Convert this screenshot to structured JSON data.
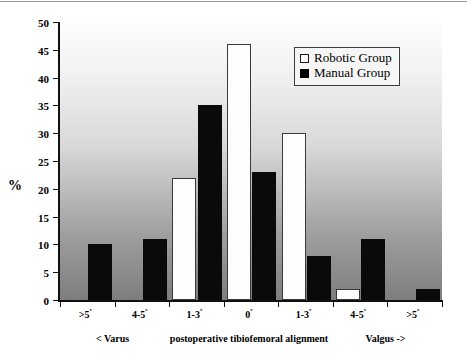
{
  "chart_data": {
    "type": "bar",
    "title": "",
    "xlabel": "postoperative tibiofemoral alignment",
    "ylabel": "%",
    "ylim": [
      0,
      50
    ],
    "yticks": [
      0,
      5,
      10,
      15,
      20,
      25,
      30,
      35,
      40,
      45,
      50
    ],
    "grid": false,
    "legend_position": "top-right",
    "categories": [
      ">5º",
      "4-5º",
      "1-3º",
      "0º",
      "1-3º",
      "4-5º",
      ">5º"
    ],
    "axis_group_labels": [
      "< Varus",
      "postoperative tibiofemoral alignment",
      "Valgus ->"
    ],
    "series": [
      {
        "name": "Robotic Group",
        "color": "#ffffff",
        "values": [
          0,
          0,
          22,
          46,
          30,
          2,
          0
        ]
      },
      {
        "name": "Manual Group",
        "color": "#000000",
        "values": [
          10,
          11,
          35,
          23,
          8,
          11,
          2
        ]
      }
    ]
  },
  "legend": {
    "items": [
      {
        "label": "Robotic Group",
        "swatch": "open-square-icon"
      },
      {
        "label": "Manual Group",
        "swatch": "filled-square-icon"
      }
    ]
  },
  "axis": {
    "y_title": "%",
    "y_tick_labels": [
      "50",
      "45",
      "40",
      "35",
      "30",
      "25",
      "20",
      "15",
      "10",
      "5",
      "0"
    ],
    "x_categories": [
      ">5",
      "4-5",
      "1-3",
      "0",
      "1-3",
      "4-5",
      ">5"
    ],
    "x_degree_symbol": "º",
    "x_left_label": "< Varus",
    "x_center_label": "postoperative tibiofemoral alignment",
    "x_right_label": "Valgus ->"
  }
}
